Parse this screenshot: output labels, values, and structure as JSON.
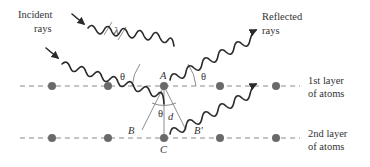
{
  "diagram": {
    "labels": {
      "incident_line1": "Incident",
      "incident_line2": "rays",
      "reflected_line1": "Reflected",
      "reflected_line2": "rays",
      "layer1_line1": "1st layer",
      "layer1_line2": "of atoms",
      "layer2_line1": "2nd layer",
      "layer2_line2": "of atoms",
      "wavelength": "λ",
      "theta": "θ",
      "point_a": "A",
      "point_b": "B",
      "point_b_prime": "B′",
      "point_c": "C",
      "spacing": "d"
    },
    "layers": [
      {
        "name": "1st layer",
        "y": 86,
        "atoms_x": [
          52,
          108,
          164,
          220,
          276
        ]
      },
      {
        "name": "2nd layer",
        "y": 138,
        "atoms_x": [
          52,
          108,
          164,
          220,
          276
        ]
      }
    ],
    "colors": {
      "ray": "#2a2a2a",
      "atom": "#6a6a6a",
      "dashed_line": "#8a8a8a",
      "text": "#333333"
    }
  }
}
